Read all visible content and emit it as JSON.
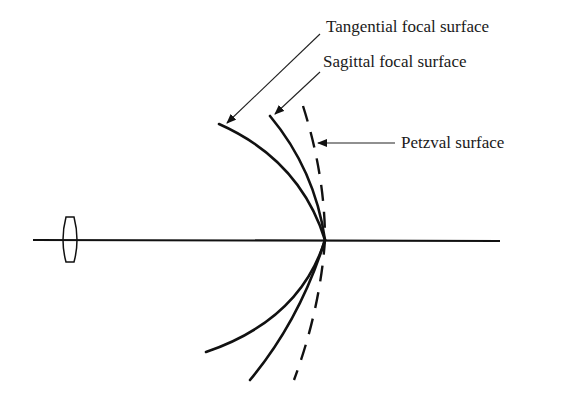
{
  "diagram": {
    "labels": {
      "tangential": "Tangential focal surface",
      "sagittal": "Sagittal focal surface",
      "petzval": "Petzval surface"
    },
    "elements": {
      "lens": "thin-lens",
      "axis": "optical-axis",
      "surfaces": [
        "tangential",
        "sagittal",
        "petzval"
      ]
    }
  }
}
